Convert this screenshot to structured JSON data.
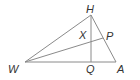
{
  "diagram": {
    "type": "triangle-geometry",
    "points": {
      "H": {
        "label": "H",
        "x": 91,
        "y": 15
      },
      "W": {
        "label": "W",
        "x": 25,
        "y": 62
      },
      "A": {
        "label": "A",
        "x": 116,
        "y": 62
      },
      "Q": {
        "label": "Q",
        "x": 91,
        "y": 62
      },
      "P": {
        "label": "P",
        "x": 103,
        "y": 38
      },
      "X": {
        "label": "X"
      }
    },
    "segments": [
      "WH",
      "HA",
      "WA",
      "HQ",
      "WP"
    ],
    "line_color": "#8a8a8a",
    "label_color": "#333333"
  }
}
